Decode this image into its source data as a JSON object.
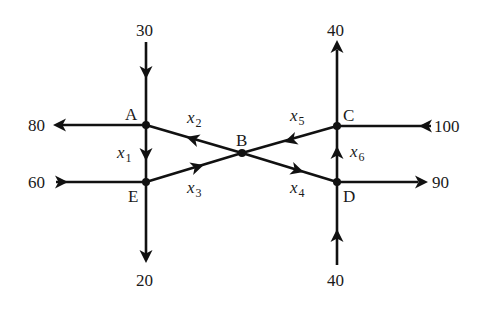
{
  "diagram": {
    "type": "traffic-flow-network",
    "nodes": [
      {
        "id": "A",
        "label": "A",
        "x": 146,
        "y": 125
      },
      {
        "id": "B",
        "label": "B",
        "x": 242,
        "y": 153
      },
      {
        "id": "C",
        "label": "C",
        "x": 337,
        "y": 126
      },
      {
        "id": "D",
        "label": "D",
        "x": 337,
        "y": 182
      },
      {
        "id": "E",
        "label": "E",
        "x": 146,
        "y": 182
      }
    ],
    "internal_edges": [
      {
        "from": "A",
        "to": "E",
        "label": "x",
        "sub": "1"
      },
      {
        "from": "B",
        "to": "A",
        "label": "x",
        "sub": "2"
      },
      {
        "from": "E",
        "to": "B",
        "label": "x",
        "sub": "3"
      },
      {
        "from": "B",
        "to": "D",
        "label": "x",
        "sub": "4"
      },
      {
        "from": "C",
        "to": "B",
        "label": "x",
        "sub": "5"
      },
      {
        "from": "D",
        "to": "C",
        "label": "x",
        "sub": "6"
      }
    ],
    "external_flows": [
      {
        "node": "A",
        "direction": "in",
        "side": "top",
        "value": "30"
      },
      {
        "node": "A",
        "direction": "out",
        "side": "left",
        "value": "80"
      },
      {
        "node": "E",
        "direction": "in",
        "side": "left",
        "value": "60"
      },
      {
        "node": "E",
        "direction": "out",
        "side": "bottom",
        "value": "20"
      },
      {
        "node": "C",
        "direction": "out",
        "side": "top",
        "value": "40"
      },
      {
        "node": "C",
        "direction": "in",
        "side": "right",
        "value": "100"
      },
      {
        "node": "D",
        "direction": "out",
        "side": "right",
        "value": "90"
      },
      {
        "node": "D",
        "direction": "in",
        "side": "bottom",
        "value": "40"
      }
    ],
    "labels": {
      "A": "A",
      "B": "B",
      "C": "C",
      "D": "D",
      "E": "E",
      "top_left": "30",
      "left_top": "80",
      "left_bottom": "60",
      "bottom_left": "20",
      "top_right": "40",
      "right_top": "100",
      "right_bottom": "90",
      "bottom_right": "40",
      "x": "x",
      "s1": "1",
      "s2": "2",
      "s3": "3",
      "s4": "4",
      "s5": "5",
      "s6": "6"
    },
    "colors": {
      "stroke": "#111111",
      "text": "#1a1a1a",
      "background": "#ffffff"
    }
  }
}
